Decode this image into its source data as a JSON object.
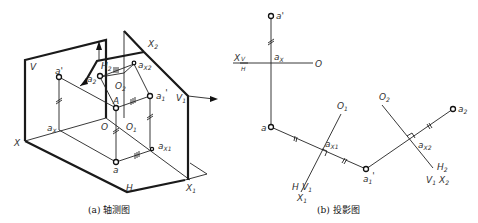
{
  "figure_a": {
    "caption": "(a) 轴测图",
    "labels": {
      "V": "V",
      "a_prime": "a'",
      "X": "X",
      "a_x": "a",
      "a_x_sub": "X",
      "O": "O",
      "O1": "O",
      "O1_sub": "1",
      "A": "A",
      "a": "a",
      "a_x1": "a",
      "a_x1_sub": "X1",
      "H": "H",
      "X1": "X",
      "X1_sub": "1",
      "V1": "V",
      "V1_sub": "1",
      "a1p": "a",
      "a1p_sub": "1",
      "a1p_prime": "'",
      "X2": "X",
      "X2_sub": "2",
      "H2": "H",
      "H2_sub": "2",
      "a2": "a",
      "a2_sub": "2",
      "O2": "O",
      "O2_sub": "2",
      "a_x2": "a",
      "a_x2_sub": "X2"
    }
  },
  "figure_b": {
    "caption": "(b) 投影图",
    "labels": {
      "a_prime": "a'",
      "X": "X",
      "V": "V",
      "H": "H",
      "a_x": "a",
      "a_x_sub": "X",
      "O": "O",
      "a": "a",
      "O1": "O",
      "O1_sub": "1",
      "a_x1": "a",
      "a_x1_sub": "X1",
      "H_lower": "H",
      "V1": "V",
      "V1_sub": "1",
      "X1": "X",
      "X1_sub": "1",
      "a1p": "a",
      "a1p_sub": "1",
      "a1p_prime": "'",
      "O2": "O",
      "O2_sub": "2",
      "a2": "a",
      "a2_sub": "2",
      "a_x2": "a",
      "a_x2_sub": "X2",
      "H2": "H",
      "H2_sub": "2",
      "V1b": "V",
      "V1b_sub": "1",
      "X2": "X",
      "X2_sub": "2"
    }
  }
}
